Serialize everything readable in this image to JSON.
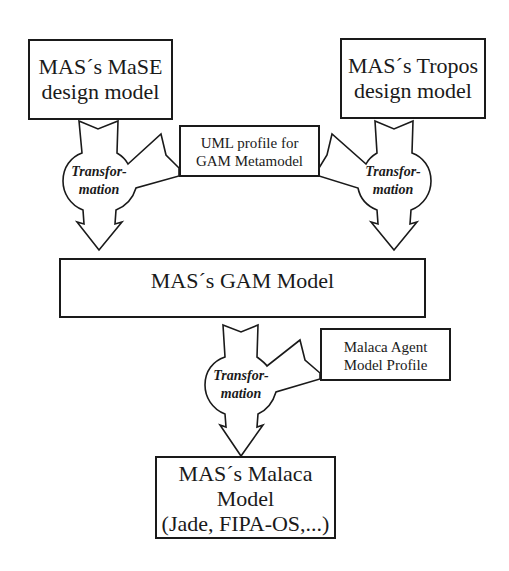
{
  "diagram": {
    "nodes": {
      "mase": {
        "line1": "MAS´s MaSE",
        "line2": "design model"
      },
      "tropos": {
        "line1": "MAS´s Tropos",
        "line2": "design model"
      },
      "uml_profile": {
        "line1": "UML profile for",
        "line2": "GAM Metamodel"
      },
      "gam": {
        "line1": "MAS´s GAM Model"
      },
      "malaca_profile": {
        "line1": "Malaca Agent",
        "line2": "Model Profile"
      },
      "malaca": {
        "line1": "MAS´s Malaca",
        "line2": "Model",
        "line3": "(Jade, FIPA-OS,...)"
      }
    },
    "transformations": {
      "left": {
        "line1": "Transfor-",
        "line2": "mation"
      },
      "right": {
        "line1": "Transfor-",
        "line2": "mation"
      },
      "bottom": {
        "line1": "Transfor-",
        "line2": "mation"
      }
    },
    "edges": [
      {
        "from": "mase",
        "to": "gam",
        "via": "uml_profile",
        "label": "Transformation"
      },
      {
        "from": "tropos",
        "to": "gam",
        "via": "uml_profile",
        "label": "Transformation"
      },
      {
        "from": "gam",
        "to": "malaca",
        "via": "malaca_profile",
        "label": "Transformation"
      }
    ]
  }
}
